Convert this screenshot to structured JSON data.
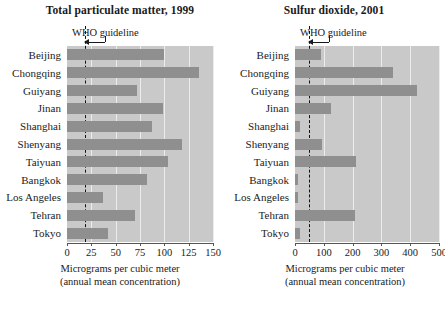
{
  "figure": {
    "categories": [
      "Beijing",
      "Chongqing",
      "Guiyang",
      "Jinan",
      "Shanghai",
      "Shenyang",
      "Taiyuan",
      "Bangkok",
      "Los Angeles",
      "Tehran",
      "Tokyo"
    ],
    "axis_caption_line1": "Micrograms per cubic meter",
    "axis_caption_line2": "(annual mean concentration)",
    "who_label": "WHO guideline",
    "colors": {
      "bar": "#8f8f8f",
      "plot_background": "#c9c9c9",
      "gridline": "#ececec",
      "guideline": "#111111",
      "text": "#1a1a1a"
    }
  },
  "chart_data": [
    {
      "type": "bar",
      "orientation": "horizontal",
      "title": "Total particulate matter, 1999",
      "xlabel": "Micrograms per cubic meter (annual mean concentration)",
      "ylabel": "",
      "xlim": [
        0,
        150
      ],
      "xticks": [
        0,
        25,
        50,
        75,
        100,
        125,
        150
      ],
      "xtick_labels": [
        "0",
        "25",
        "50",
        "75",
        "100",
        "125",
        "150"
      ],
      "grid": true,
      "legend": false,
      "categories": [
        "Beijing",
        "Chongqing",
        "Guiyang",
        "Jinan",
        "Shanghai",
        "Shenyang",
        "Taiyuan",
        "Bangkok",
        "Los Angeles",
        "Tehran",
        "Tokyo"
      ],
      "values": [
        100,
        136,
        72,
        99,
        87,
        118,
        104,
        82,
        37,
        70,
        42
      ],
      "annotations": [
        {
          "label": "WHO guideline",
          "type": "vline",
          "value": 18
        }
      ]
    },
    {
      "type": "bar",
      "orientation": "horizontal",
      "title": "Sulfur dioxide, 2001",
      "xlabel": "Micrograms per cubic meter (annual mean concentration)",
      "ylabel": "",
      "xlim": [
        0,
        500
      ],
      "xticks": [
        0,
        100,
        200,
        300,
        400,
        500
      ],
      "xtick_labels": [
        "0",
        "100",
        "200",
        "300",
        "400",
        "500"
      ],
      "grid": true,
      "legend": false,
      "categories": [
        "Beijing",
        "Chongqing",
        "Guiyang",
        "Jinan",
        "Shanghai",
        "Shenyang",
        "Taiyuan",
        "Bangkok",
        "Los Angeles",
        "Tehran",
        "Tokyo"
      ],
      "values": [
        90,
        340,
        424,
        125,
        16,
        95,
        211,
        11,
        9,
        208,
        18
      ],
      "annotations": [
        {
          "label": "WHO guideline",
          "type": "vline",
          "value": 50
        }
      ]
    }
  ]
}
